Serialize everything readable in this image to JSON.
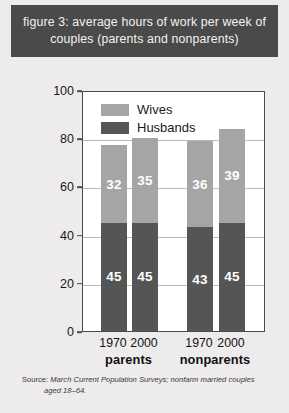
{
  "title": "figure 3: average hours of work per week of couples (parents and nonparents)",
  "source_label": "Source:",
  "source_line1": "March Current Population Surveys; nonfarm married couples",
  "source_line2": "aged 18–64.",
  "colors": {
    "wives": "#a5a5a5",
    "husbands": "#555555",
    "banner": "#4a4a4a",
    "banner_text": "#f2f2f2",
    "page_background": "#edebeb",
    "plot_background": "#ffffff",
    "axis": "#4a4a4a",
    "gridline": "#b9b9b9",
    "value_label": "#ffffff"
  },
  "chart_data": {
    "type": "bar",
    "subtype": "stacked",
    "title": "figure 3: average hours of work per week of couples (parents and nonparents)",
    "xlabel": "",
    "ylabel": "total hours worked in a week by married couples",
    "ylim": [
      0,
      100
    ],
    "yticks": [
      0,
      20,
      40,
      60,
      80,
      100
    ],
    "ytick_labels": [
      "0",
      "20",
      "40",
      "60",
      "80",
      "100"
    ],
    "grid": true,
    "legend_position": "top-left inside plot",
    "categories": [
      "1970",
      "2000",
      "1970",
      "2000"
    ],
    "groups": [
      {
        "label": "parents",
        "categories": [
          "1970",
          "2000"
        ]
      },
      {
        "label": "nonparents",
        "categories": [
          "1970",
          "2000"
        ]
      }
    ],
    "series": [
      {
        "name": "Husbands",
        "color": "#555555",
        "values": [
          45,
          45,
          43,
          45
        ]
      },
      {
        "name": "Wives",
        "color": "#a5a5a5",
        "values": [
          32,
          35,
          36,
          39
        ]
      }
    ],
    "totals": [
      77,
      80,
      79,
      84
    ],
    "annotations": []
  },
  "legend": [
    {
      "label": "Wives",
      "key": "wives"
    },
    {
      "label": "Husbands",
      "key": "husbands"
    }
  ],
  "bars": [
    {
      "group": "parents",
      "year": "1970",
      "husbands": 45,
      "wives": 32,
      "total": 77
    },
    {
      "group": "parents",
      "year": "2000",
      "husbands": 45,
      "wives": 35,
      "total": 80
    },
    {
      "group": "nonparents",
      "year": "1970",
      "husbands": 43,
      "wives": 36,
      "total": 79
    },
    {
      "group": "nonparents",
      "year": "2000",
      "husbands": 45,
      "wives": 39,
      "total": 84
    }
  ]
}
